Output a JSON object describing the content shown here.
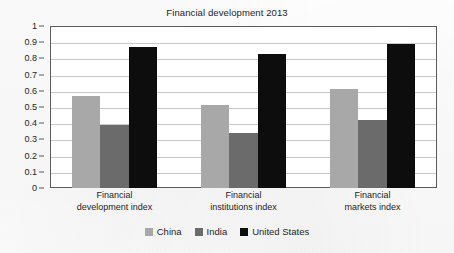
{
  "chart_data": {
    "type": "bar",
    "title": "Financial development 2013",
    "xlabel": "",
    "ylabel": "",
    "ylim": [
      0,
      1
    ],
    "ytick_step": 0.1,
    "grid": true,
    "legend_position": "bottom",
    "categories": [
      "Financial development index",
      "Financial institutions index",
      "Financial markets index"
    ],
    "category_lines": [
      [
        "Financial",
        "development index"
      ],
      [
        "Financial",
        "institutions index"
      ],
      [
        "Financial",
        "markets index"
      ]
    ],
    "ytick_labels": [
      "1",
      "0.9",
      "0.8",
      "0.7",
      "0.6",
      "0.5",
      "0.4",
      "0.3",
      "0.2",
      "0.1",
      "0"
    ],
    "ytick_values": [
      1,
      0.9,
      0.8,
      0.7,
      0.6,
      0.5,
      0.4,
      0.3,
      0.2,
      0.1,
      0
    ],
    "series": [
      {
        "name": "China",
        "color": "#a8a8a8",
        "values": [
          0.57,
          0.51,
          0.61
        ]
      },
      {
        "name": "India",
        "color": "#6b6b6b",
        "values": [
          0.39,
          0.34,
          0.42
        ]
      },
      {
        "name": "United States",
        "color": "#0d0d0d",
        "values": [
          0.87,
          0.83,
          0.89
        ]
      }
    ]
  },
  "colors": {
    "china": "#a8a8a8",
    "india": "#6b6b6b",
    "united_states": "#0d0d0d",
    "gridline": "#c9c9c9",
    "axis": "#5b5b5b",
    "text": "#1d1d1d",
    "plot_background": "#ffffff",
    "page_background": "#fdfdfd"
  }
}
